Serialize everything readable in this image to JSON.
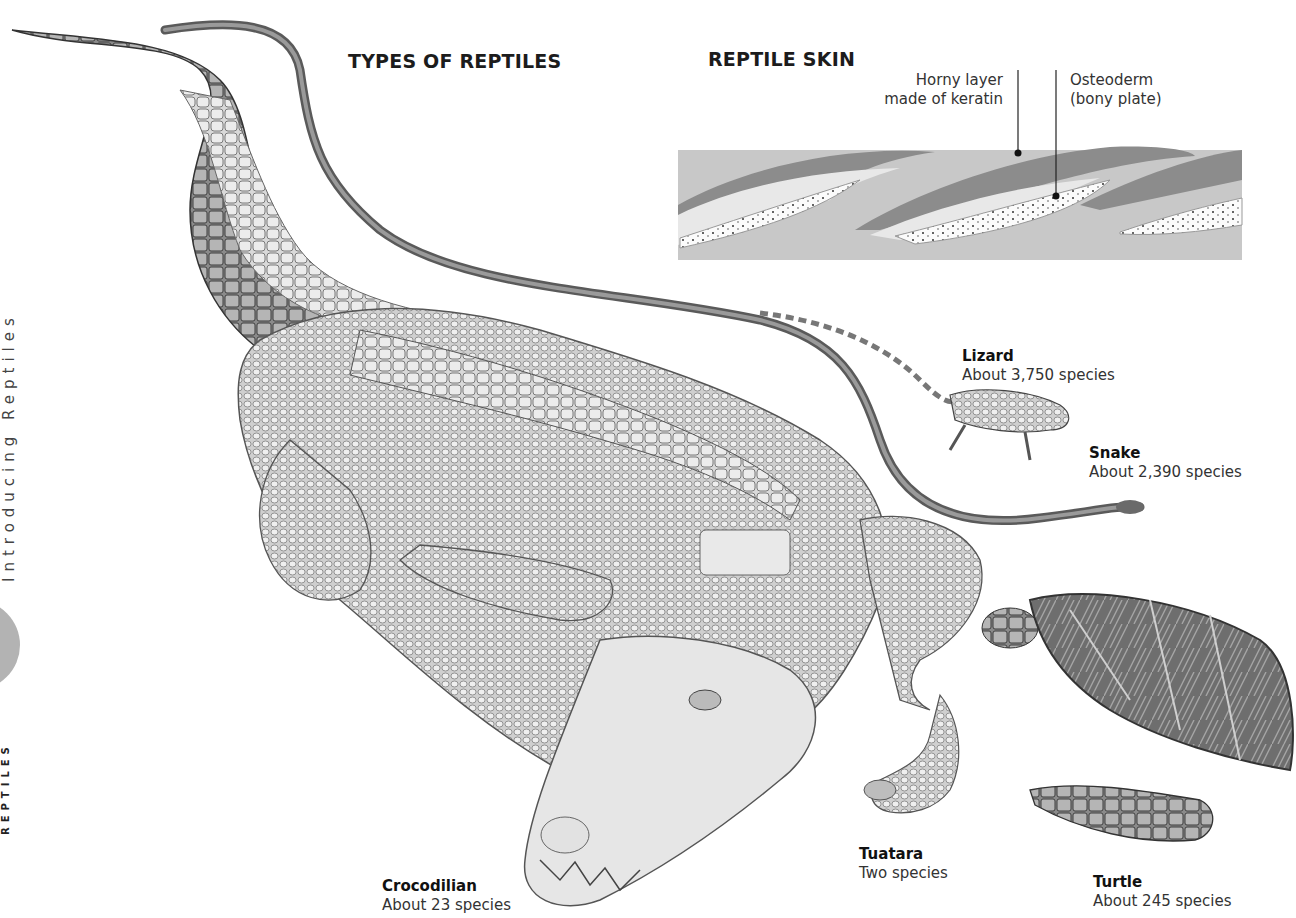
{
  "page": {
    "title_fragment": "",
    "side_running_head": "Introducing Reptiles",
    "side_section": "REPTILES",
    "colors": {
      "background": "#ffffff",
      "tab_circle": "#b3b3b3",
      "skin_base": "#c8c8c8",
      "keratin": "#8c8c8c",
      "text": "#1a1a1a"
    }
  },
  "types_section": {
    "heading": "TYPES OF REPTILES",
    "reptiles": [
      {
        "name": "Lizard",
        "count": "About 3,750 species"
      },
      {
        "name": "Snake",
        "count": "About 2,390 species"
      },
      {
        "name": "Crocodilian",
        "count": "About 23 species"
      },
      {
        "name": "Tuatara",
        "count": "Two species"
      },
      {
        "name": "Turtle",
        "count": "About 245 species"
      }
    ]
  },
  "skin_section": {
    "heading": "REPTILE SKIN",
    "labels": [
      {
        "text_line1": "Horny layer",
        "text_line2": "made of keratin"
      },
      {
        "text_line1": "Osteoderm",
        "text_line2": "(bony plate)"
      }
    ]
  },
  "illustrations": [
    "crocodile-illustration",
    "snake-illustration",
    "lizard-illustration",
    "tuatara-illustration",
    "turtle-illustration",
    "skin-cross-section-diagram"
  ]
}
